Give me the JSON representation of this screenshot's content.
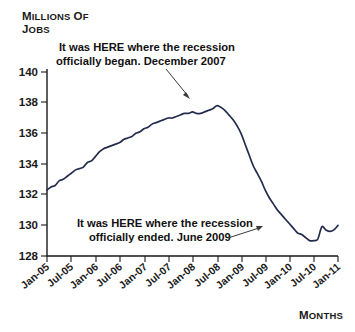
{
  "chart_data": {
    "type": "line",
    "title": "",
    "ylabel": "Millions of Jobs",
    "xlabel": "Months",
    "ylim": [
      128,
      140
    ],
    "yticks": [
      128,
      130,
      132,
      134,
      136,
      138,
      140
    ],
    "grid": false,
    "legend": "none",
    "line_color": "#242c4e",
    "categories": [
      "Jan-05",
      "Jul-05",
      "Jan-06",
      "Jul-06",
      "Jan-07",
      "Jul-07",
      "Jan-08",
      "Jul-08",
      "Jan-09",
      "Jul-09",
      "Jan-10",
      "Jul-10",
      "Jan-11"
    ],
    "xtick_labels": [
      "Jan-05",
      "Jul-05",
      "Jan-06",
      "Jul-06",
      "Jan-07",
      "Jul-07",
      "Jan-08",
      "Jul-08",
      "Jan-09",
      "Jul-09",
      "Jan-10",
      "Jul-10",
      "Jan-11"
    ],
    "series": [
      {
        "name": "Total nonfarm employment",
        "units": "millions of jobs",
        "x": [
          "Jan-05",
          "Feb-05",
          "Mar-05",
          "Apr-05",
          "May-05",
          "Jun-05",
          "Jul-05",
          "Aug-05",
          "Sep-05",
          "Oct-05",
          "Nov-05",
          "Dec-05",
          "Jan-06",
          "Feb-06",
          "Mar-06",
          "Apr-06",
          "May-06",
          "Jun-06",
          "Jul-06",
          "Aug-06",
          "Sep-06",
          "Oct-06",
          "Nov-06",
          "Dec-06",
          "Jan-07",
          "Feb-07",
          "Mar-07",
          "Apr-07",
          "May-07",
          "Jun-07",
          "Jul-07",
          "Aug-07",
          "Sep-07",
          "Oct-07",
          "Nov-07",
          "Dec-07",
          "Jan-08",
          "Feb-08",
          "Mar-08",
          "Apr-08",
          "May-08",
          "Jun-08",
          "Jul-08",
          "Aug-08",
          "Sep-08",
          "Oct-08",
          "Nov-08",
          "Dec-08",
          "Jan-09",
          "Feb-09",
          "Mar-09",
          "Apr-09",
          "May-09",
          "Jun-09",
          "Jul-09",
          "Aug-09",
          "Sep-09",
          "Oct-09",
          "Nov-09",
          "Dec-09",
          "Jan-10",
          "Feb-10",
          "Mar-10",
          "Apr-10",
          "May-10",
          "Jun-10",
          "Jul-10",
          "Aug-10",
          "Sep-10",
          "Oct-10",
          "Nov-10",
          "Dec-10",
          "Jan-11"
        ],
        "values": [
          132.3,
          132.5,
          132.6,
          132.9,
          133.0,
          133.2,
          133.4,
          133.6,
          133.7,
          133.8,
          134.1,
          134.2,
          134.5,
          134.8,
          135.0,
          135.1,
          135.2,
          135.3,
          135.4,
          135.6,
          135.7,
          135.8,
          136.0,
          136.1,
          136.3,
          136.4,
          136.6,
          136.7,
          136.8,
          136.9,
          137.0,
          137.0,
          137.1,
          137.2,
          137.3,
          137.3,
          137.4,
          137.3,
          137.3,
          137.4,
          137.5,
          137.6,
          137.8,
          137.7,
          137.5,
          137.2,
          136.9,
          136.5,
          136.0,
          135.3,
          134.6,
          133.9,
          133.4,
          132.9,
          132.3,
          131.8,
          131.4,
          131.0,
          130.7,
          130.4,
          130.1,
          129.8,
          129.5,
          129.4,
          129.2,
          129.0,
          129.0,
          129.1,
          129.9,
          129.7,
          129.6,
          129.7,
          130.0
        ]
      }
    ],
    "annotations": [
      {
        "id": "recession-start",
        "line1": "It was HERE where the recession",
        "line2": "officially began. December 2007",
        "points_to": {
          "x": "Dec-07",
          "y": 137.4
        }
      },
      {
        "id": "recession-end",
        "line1": "It was HERE where the recession",
        "line2": "officially ended. June 2009",
        "points_to": {
          "x": "Jun-09",
          "y": 130.0
        }
      }
    ]
  }
}
